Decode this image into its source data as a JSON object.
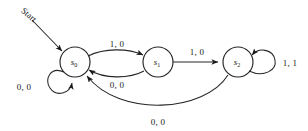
{
  "diagram": {
    "title": "Start",
    "type": "finite-state-machine",
    "start_label": "Start",
    "states": [
      {
        "id": "s0",
        "name": "s",
        "sub": "0",
        "cx": 75,
        "cy": 62,
        "r": 15
      },
      {
        "id": "s1",
        "name": "s",
        "sub": "1",
        "cx": 158,
        "cy": 62,
        "r": 15
      },
      {
        "id": "s2",
        "name": "s",
        "sub": "2",
        "cx": 238,
        "cy": 62,
        "r": 15
      }
    ],
    "transitions": [
      {
        "id": "t-s0-s0",
        "from": "s0",
        "to": "s0",
        "label": "0, 0",
        "kind": "self-loop",
        "label_x": 24,
        "label_y": 90
      },
      {
        "id": "t-s0-s1",
        "from": "s0",
        "to": "s1",
        "label": "1, 0",
        "kind": "arc-top",
        "label_x": 117,
        "label_y": 47
      },
      {
        "id": "t-s1-s0",
        "from": "s1",
        "to": "s0",
        "label": "0, 0",
        "kind": "arc-bottom",
        "label_x": 117,
        "label_y": 88
      },
      {
        "id": "t-s1-s2",
        "from": "s1",
        "to": "s2",
        "label": "1, 0",
        "kind": "straight",
        "label_x": 197,
        "label_y": 55
      },
      {
        "id": "t-s2-s2",
        "from": "s2",
        "to": "s2",
        "label": "1, 1",
        "kind": "self-loop",
        "label_x": 290,
        "label_y": 66
      },
      {
        "id": "t-s2-s0",
        "from": "s2",
        "to": "s0",
        "label": "0, 0",
        "kind": "long-arc",
        "label_x": 158,
        "label_y": 125
      }
    ],
    "colors": {
      "stroke": "#262626",
      "text": "#1a1a1a",
      "background": "#ffffff"
    }
  }
}
